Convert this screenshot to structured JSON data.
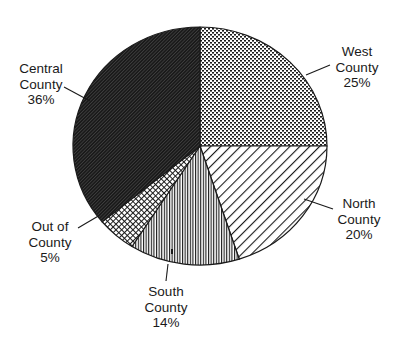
{
  "chart_data": {
    "type": "pie",
    "title": "",
    "start_angle": "12 o'clock",
    "direction": "clockwise",
    "slices": [
      {
        "name": "West County",
        "line1": "West",
        "line2": "County",
        "value": 25,
        "pct_label": "25%",
        "pattern": "dots"
      },
      {
        "name": "North County",
        "line1": "North",
        "line2": "County",
        "value": 20,
        "pct_label": "20%",
        "pattern": "diagonal-wide"
      },
      {
        "name": "South County",
        "line1": "South",
        "line2": "County",
        "value": 14,
        "pct_label": "14%",
        "pattern": "vertical"
      },
      {
        "name": "Out of County",
        "line1": "Out of",
        "line2": "County",
        "value": 5,
        "pct_label": "5%",
        "pattern": "crosshatch"
      },
      {
        "name": "Central County",
        "line1": "Central",
        "line2": "County",
        "value": 36,
        "pct_label": "36%",
        "pattern": "diagonal-dense"
      }
    ],
    "colors": {
      "ink": "#1a1a1a",
      "background": "#ffffff"
    }
  }
}
